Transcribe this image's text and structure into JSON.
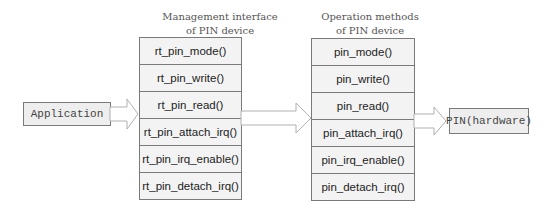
{
  "application": {
    "label": "Application"
  },
  "management": {
    "title": "Management interface\nof PIN device",
    "items": [
      "rt_pin_mode()",
      "rt_pin_write()",
      "rt_pin_read()",
      "rt_pin_attach_irq()",
      "rt_pin_irq_enable()",
      "rt_pin_detach_irq()"
    ]
  },
  "operation": {
    "title": "Operation methods\nof PIN device",
    "items": [
      "pin_mode()",
      "pin_write()",
      "pin_read()",
      "pin_attach_irq()",
      "pin_irq_enable()",
      "pin_detach_irq()"
    ]
  },
  "hardware": {
    "label": "PIN(hardware)"
  },
  "colors": {
    "border": "#7a7a7a",
    "fill": "#f3f3f3",
    "arrow": "#b0b0b0"
  }
}
